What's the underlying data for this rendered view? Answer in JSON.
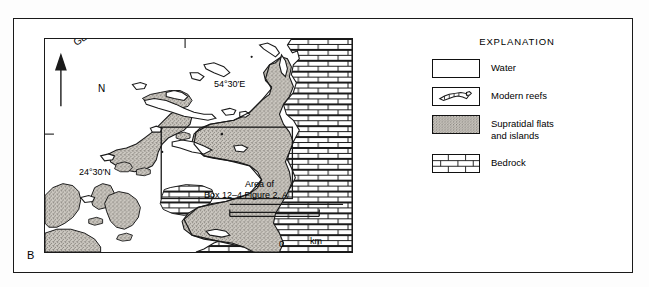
{
  "figure": {
    "panel_letter": "B",
    "background_color": "#ffffff",
    "frame_color": "#1a1a1a"
  },
  "map": {
    "longitude_label": "54°30′E",
    "latitude_label": "24°30′N",
    "island_label_line1": "Abu Dhabi",
    "island_label_line2": "Is.",
    "sea_label_line1": "Persian",
    "sea_label_line2": "Gulf",
    "north_arrow_label": "N",
    "inset_label_line1": "Area of",
    "inset_label_line2": "Box 12–4 Figure 2, A",
    "scale": {
      "min": "0",
      "unit": "km",
      "max": "20"
    },
    "colors": {
      "water": "#ffffff",
      "supratidal": "#b9b5ae",
      "bedrock": "#ffffff",
      "ink": "#111111"
    }
  },
  "legend": {
    "title": "EXPLANATION",
    "items": [
      {
        "label": "Water",
        "pattern": "water"
      },
      {
        "label": "Modern reefs",
        "pattern": "modern-reefs"
      },
      {
        "label": "Supratidal flats\nand islands",
        "pattern": "supratidal"
      },
      {
        "label": "Bedrock",
        "pattern": "bedrock"
      }
    ],
    "item_labels": {
      "water": "Water",
      "modern_reefs": "Modern reefs",
      "supratidal_line1": "Supratidal flats",
      "supratidal_line2": "and islands",
      "bedrock": "Bedrock"
    }
  }
}
